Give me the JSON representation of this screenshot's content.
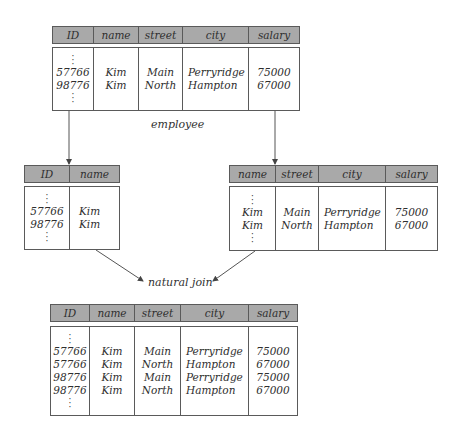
{
  "diagram": {
    "type": "relational-decomposition",
    "colors": {
      "header_fill": "#a9a9a9",
      "border": "#5a5a5a",
      "text": "#2e2e2e",
      "background": "#ffffff"
    },
    "labels": {
      "employee": "employee",
      "natural_join": "natural join"
    },
    "employee_table": {
      "headers": [
        "ID",
        "name",
        "street",
        "city",
        "salary"
      ],
      "ellipsis": "⋮",
      "columns": {
        "id": [
          "57766",
          "98776"
        ],
        "name": [
          "Kim",
          "Kim"
        ],
        "street": [
          "Main",
          "North"
        ],
        "city": [
          "Perryridge",
          "Hampton"
        ],
        "salary": [
          "75000",
          "67000"
        ]
      }
    },
    "left_projection": {
      "headers": [
        "ID",
        "name"
      ],
      "columns": {
        "id": [
          "57766",
          "98776"
        ],
        "name": [
          "Kim",
          "Kim"
        ]
      }
    },
    "right_projection": {
      "headers": [
        "name",
        "street",
        "city",
        "salary"
      ],
      "columns": {
        "name": [
          "Kim",
          "Kim"
        ],
        "street": [
          "Main",
          "North"
        ],
        "city": [
          "Perryridge",
          "Hampton"
        ],
        "salary": [
          "75000",
          "67000"
        ]
      }
    },
    "join_result": {
      "headers": [
        "ID",
        "name",
        "street",
        "city",
        "salary"
      ],
      "columns": {
        "id": [
          "57766",
          "57766",
          "98776",
          "98776"
        ],
        "name": [
          "Kim",
          "Kim",
          "Kim",
          "Kim"
        ],
        "street": [
          "Main",
          "North",
          "Main",
          "North"
        ],
        "city": [
          "Perryridge",
          "Hampton",
          "Perryridge",
          "Hampton"
        ],
        "salary": [
          "75000",
          "67000",
          "75000",
          "67000"
        ]
      }
    }
  }
}
